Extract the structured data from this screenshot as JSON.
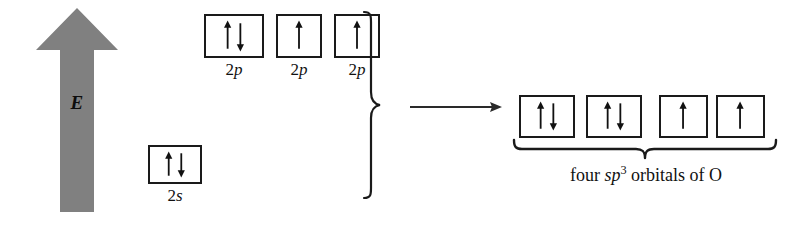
{
  "figure": {
    "background_color": "#ffffff",
    "ink_color": "#111111",
    "arrow_fill_color": "#808080"
  },
  "energy_axis": {
    "name": "energy-arrow",
    "label": "E",
    "direction": "up",
    "color": "#808080"
  },
  "left_configuration": {
    "orbitals": [
      {
        "id": "2p-1",
        "label_prefix": "2",
        "label_italic": "p",
        "electrons": "updown",
        "spins": [
          "up",
          "down"
        ],
        "x": 204,
        "y": 14,
        "w": 60,
        "h": 44
      },
      {
        "id": "2p-2",
        "label_prefix": "2",
        "label_italic": "p",
        "electrons": "up",
        "spins": [
          "up"
        ],
        "x": 276,
        "y": 14,
        "w": 46,
        "h": 44
      },
      {
        "id": "2p-3",
        "label_prefix": "2",
        "label_italic": "p",
        "electrons": "up",
        "spins": [
          "up"
        ],
        "x": 334,
        "y": 14,
        "w": 46,
        "h": 44
      },
      {
        "id": "2s-1",
        "label_prefix": "2",
        "label_italic": "s",
        "electrons": "updown",
        "spins": [
          "up",
          "down"
        ],
        "x": 148,
        "y": 145,
        "w": 54,
        "h": 39
      }
    ]
  },
  "transition": {
    "brace_name": "grouping-brace",
    "arrow_name": "transformation-arrow",
    "arrow_direction": "right"
  },
  "right_configuration": {
    "caption_plain_1": "four ",
    "caption_italic": "sp",
    "caption_superscript": "3",
    "caption_plain_2": " orbitals of O",
    "caption_full": "four sp3 orbitals of O",
    "orbitals": [
      {
        "id": "sp3-1",
        "electrons": "updown",
        "spins": [
          "up",
          "down"
        ],
        "x": 519,
        "y": 95,
        "w": 56,
        "h": 43
      },
      {
        "id": "sp3-2",
        "electrons": "updown",
        "spins": [
          "up",
          "down"
        ],
        "x": 586,
        "y": 95,
        "w": 56,
        "h": 43
      },
      {
        "id": "sp3-3",
        "electrons": "up",
        "spins": [
          "up"
        ],
        "x": 659,
        "y": 95,
        "w": 49,
        "h": 43
      },
      {
        "id": "sp3-4",
        "electrons": "up",
        "spins": [
          "up"
        ],
        "x": 716,
        "y": 95,
        "w": 49,
        "h": 43
      }
    ]
  }
}
